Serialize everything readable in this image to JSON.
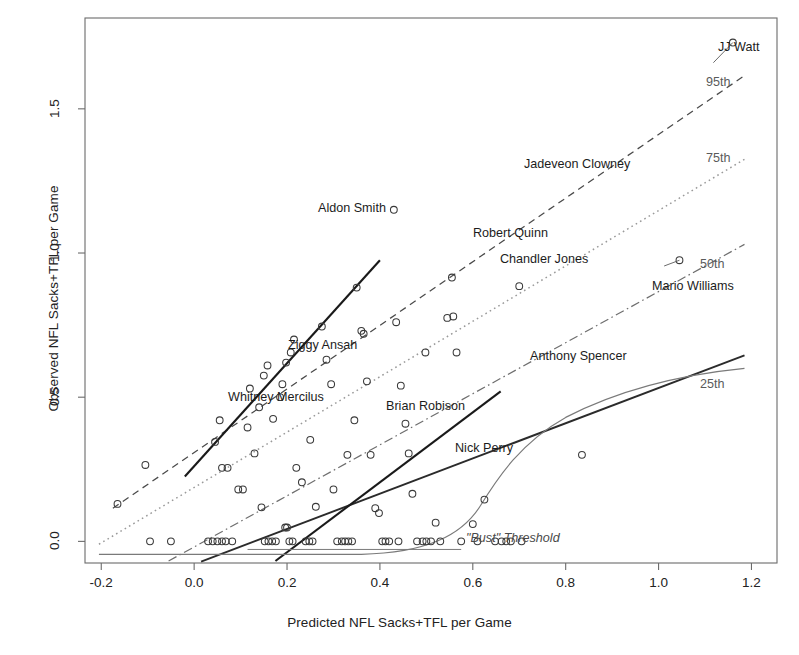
{
  "chart_data": {
    "type": "scatter",
    "title": "",
    "xlabel": "Predicted NFL Sacks+TFL per Game",
    "ylabel": "Observed NFL Sacks+TFL per Game",
    "xlim": [
      -0.235,
      1.255
    ],
    "ylim": [
      -0.075,
      1.815
    ],
    "xticks": [
      -0.2,
      0.0,
      0.2,
      0.4,
      0.6,
      0.8,
      1.0,
      1.2
    ],
    "xtick_labels": [
      "-0.2",
      "0.0",
      "0.2",
      "0.4",
      "0.6",
      "0.8",
      "1.0",
      "1.2"
    ],
    "yticks": [
      0.0,
      0.5,
      1.0,
      1.5
    ],
    "ytick_labels": [
      "0.0",
      "0.5",
      "1.0",
      "1.5"
    ],
    "grid": false,
    "legend": "none",
    "marker": "open-circle",
    "points": [
      {
        "x": -0.165,
        "y": 0.13
      },
      {
        "x": -0.105,
        "y": 0.265
      },
      {
        "x": -0.095,
        "y": 0.0
      },
      {
        "x": -0.05,
        "y": 0.0
      },
      {
        "x": 0.03,
        "y": 0.0
      },
      {
        "x": 0.04,
        "y": 0.0
      },
      {
        "x": 0.05,
        "y": 0.0
      },
      {
        "x": 0.06,
        "y": 0.0
      },
      {
        "x": 0.068,
        "y": 0.0
      },
      {
        "x": 0.082,
        "y": 0.0
      },
      {
        "x": 0.045,
        "y": 0.345
      },
      {
        "x": 0.055,
        "y": 0.42
      },
      {
        "x": 0.06,
        "y": 0.255
      },
      {
        "x": 0.072,
        "y": 0.255
      },
      {
        "x": 0.095,
        "y": 0.18
      },
      {
        "x": 0.105,
        "y": 0.18
      },
      {
        "x": 0.115,
        "y": 0.395
      },
      {
        "x": 0.12,
        "y": 0.53
      },
      {
        "x": 0.13,
        "y": 0.305
      },
      {
        "x": 0.14,
        "y": 0.465
      },
      {
        "x": 0.145,
        "y": 0.118
      },
      {
        "x": 0.152,
        "y": 0.0
      },
      {
        "x": 0.16,
        "y": 0.0
      },
      {
        "x": 0.168,
        "y": 0.0
      },
      {
        "x": 0.176,
        "y": 0.0
      },
      {
        "x": 0.15,
        "y": 0.575
      },
      {
        "x": 0.158,
        "y": 0.61
      },
      {
        "x": 0.17,
        "y": 0.425
      },
      {
        "x": 0.185,
        "y": 0.5
      },
      {
        "x": 0.19,
        "y": 0.545
      },
      {
        "x": 0.196,
        "y": 0.048
      },
      {
        "x": 0.2,
        "y": 0.048
      },
      {
        "x": 0.205,
        "y": 0.0
      },
      {
        "x": 0.212,
        "y": 0.0
      },
      {
        "x": 0.198,
        "y": 0.62
      },
      {
        "x": 0.208,
        "y": 0.655
      },
      {
        "x": 0.215,
        "y": 0.7
      },
      {
        "x": 0.22,
        "y": 0.255
      },
      {
        "x": 0.232,
        "y": 0.205
      },
      {
        "x": 0.24,
        "y": 0.0
      },
      {
        "x": 0.248,
        "y": 0.0
      },
      {
        "x": 0.255,
        "y": 0.0
      },
      {
        "x": 0.25,
        "y": 0.352
      },
      {
        "x": 0.262,
        "y": 0.12
      },
      {
        "x": 0.275,
        "y": 0.745
      },
      {
        "x": 0.285,
        "y": 0.63
      },
      {
        "x": 0.295,
        "y": 0.545
      },
      {
        "x": 0.3,
        "y": 0.18
      },
      {
        "x": 0.308,
        "y": 0.0
      },
      {
        "x": 0.318,
        "y": 0.0
      },
      {
        "x": 0.325,
        "y": 0.0
      },
      {
        "x": 0.332,
        "y": 0.0
      },
      {
        "x": 0.34,
        "y": 0.0
      },
      {
        "x": 0.33,
        "y": 0.3
      },
      {
        "x": 0.345,
        "y": 0.42
      },
      {
        "x": 0.35,
        "y": 0.88
      },
      {
        "x": 0.36,
        "y": 0.73
      },
      {
        "x": 0.365,
        "y": 0.72
      },
      {
        "x": 0.372,
        "y": 0.555
      },
      {
        "x": 0.38,
        "y": 0.3
      },
      {
        "x": 0.39,
        "y": 0.115
      },
      {
        "x": 0.398,
        "y": 0.098
      },
      {
        "x": 0.405,
        "y": 0.0
      },
      {
        "x": 0.412,
        "y": 0.0
      },
      {
        "x": 0.42,
        "y": 0.0
      },
      {
        "x": 0.44,
        "y": 0.0
      },
      {
        "x": 0.43,
        "y": 1.15
      },
      {
        "x": 0.435,
        "y": 0.76
      },
      {
        "x": 0.445,
        "y": 0.54
      },
      {
        "x": 0.455,
        "y": 0.408
      },
      {
        "x": 0.462,
        "y": 0.305
      },
      {
        "x": 0.47,
        "y": 0.165
      },
      {
        "x": 0.48,
        "y": 0.0
      },
      {
        "x": 0.492,
        "y": 0.0
      },
      {
        "x": 0.5,
        "y": 0.0
      },
      {
        "x": 0.51,
        "y": 0.0
      },
      {
        "x": 0.498,
        "y": 0.655
      },
      {
        "x": 0.52,
        "y": 0.065
      },
      {
        "x": 0.53,
        "y": 0.0
      },
      {
        "x": 0.545,
        "y": 0.775
      },
      {
        "x": 0.555,
        "y": 0.915
      },
      {
        "x": 0.558,
        "y": 0.78
      },
      {
        "x": 0.565,
        "y": 0.655
      },
      {
        "x": 0.575,
        "y": 0.0
      },
      {
        "x": 0.6,
        "y": 0.06
      },
      {
        "x": 0.61,
        "y": 0.0
      },
      {
        "x": 0.625,
        "y": 0.145
      },
      {
        "x": 0.648,
        "y": 0.0
      },
      {
        "x": 0.662,
        "y": 0.0
      },
      {
        "x": 0.672,
        "y": 0.0
      },
      {
        "x": 0.682,
        "y": 0.0
      },
      {
        "x": 0.705,
        "y": 0.0
      },
      {
        "x": 0.7,
        "y": 0.885
      },
      {
        "x": 0.835,
        "y": 0.3
      },
      {
        "x": 1.045,
        "y": 0.975
      },
      {
        "x": 1.16,
        "y": 1.73
      }
    ],
    "annotations": [
      {
        "name": "JJ Watt",
        "x": 1.16,
        "y": 1.73,
        "style": "player"
      },
      {
        "name": "Jadeveon Clowney",
        "x": 0.66,
        "y": 1.365,
        "style": "player"
      },
      {
        "name": "Aldon Smith",
        "x": 0.43,
        "y": 1.15,
        "style": "player"
      },
      {
        "name": "Robert Quinn",
        "x": 0.56,
        "y": 1.075,
        "style": "player"
      },
      {
        "name": "Chandler Jones",
        "x": 0.638,
        "y": 0.985,
        "style": "player"
      },
      {
        "name": "Mario Williams",
        "x": 1.045,
        "y": 0.975,
        "style": "player"
      },
      {
        "name": "Ziggy Ansah",
        "x": 0.25,
        "y": 0.66,
        "style": "player"
      },
      {
        "name": "Anthony Spencer",
        "x": 0.835,
        "y": 0.63,
        "style": "player"
      },
      {
        "name": "Whitney Mercilus",
        "x": 0.12,
        "y": 0.53,
        "style": "player"
      },
      {
        "name": "Brian Robison",
        "x": 0.43,
        "y": 0.45,
        "style": "player"
      },
      {
        "name": "Nick Perry",
        "x": 0.6,
        "y": 0.31,
        "style": "player"
      },
      {
        "name": "\"Bust\" Threshold",
        "x": 0.76,
        "y": 0.03,
        "style": "bust"
      }
    ],
    "percentile_lines": [
      {
        "label": "95th",
        "style": "dashed"
      },
      {
        "label": "75th",
        "style": "dotted"
      },
      {
        "label": "50th",
        "style": "dash-dot"
      },
      {
        "label": "25th",
        "style": "solid"
      }
    ]
  },
  "axes": {
    "xlabel": "Predicted NFL Sacks+TFL per Game",
    "ylabel": "Observed NFL Sacks+TFL per Game",
    "xticks": [
      "-0.2",
      "0.0",
      "0.2",
      "0.4",
      "0.6",
      "0.8",
      "1.0",
      "1.2"
    ],
    "yticks": [
      "0.0",
      "0.5",
      "1.0",
      "1.5"
    ]
  },
  "labels": {
    "jj_watt": "JJ Watt",
    "jadeveon_clowney": "Jadeveon Clowney",
    "aldon_smith": "Aldon Smith",
    "robert_quinn": "Robert Quinn",
    "chandler_jones": "Chandler Jones",
    "mario_williams": "Mario Williams",
    "ziggy_ansah": "Ziggy Ansah",
    "anthony_spencer": "Anthony Spencer",
    "whitney_mercilus": "Whitney Mercilus",
    "brian_robison": "Brian Robison",
    "nick_perry": "Nick Perry",
    "bust_threshold": "\"Bust\" Threshold",
    "p95": "95th",
    "p75": "75th",
    "p50": "50th",
    "p25": "25th"
  },
  "colors": {
    "axis": "#555555",
    "frame": "#6b6b6b",
    "point": "#3a3a3a",
    "line_95": "#4a4a4a",
    "line_75": "#9a9a9a",
    "line_50": "#6e6e6e",
    "line_25": "#2b2b2b",
    "bust": "#7a7a7a",
    "text": "#1c1c1c",
    "pct_text": "#5a5a5a"
  }
}
